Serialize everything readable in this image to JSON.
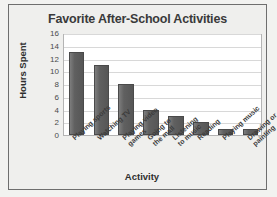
{
  "chart_data": {
    "type": "bar",
    "title": "Favorite After-School Activities",
    "xlabel": "Activity",
    "ylabel": "Hours Spent",
    "categories": [
      "Playing sports",
      "Watching TV",
      "Playing video games",
      "Going to the mall",
      "Listening to music",
      "Reading",
      "Playing music",
      "Drawing or painting"
    ],
    "category_lines": [
      "Playing sports",
      "Watching TV",
      "Playing video\ngames",
      "Going to\nthe mall",
      "Listening\nto music",
      "Reading",
      "Playing music",
      "Drawing or\npainting"
    ],
    "values": [
      13,
      11,
      8,
      4,
      3,
      2,
      1,
      1
    ],
    "ylim": [
      0,
      16
    ],
    "ytick_step": 2,
    "yticks": [
      "0",
      "2",
      "4",
      "6",
      "8",
      "10",
      "12",
      "14",
      "16"
    ],
    "grid": true,
    "legend": false,
    "bar_color": "#5e5e5e",
    "plot_background": "#ffffff",
    "figure_background": "#efefed",
    "gridline_color": "#d8d8d8",
    "title_color": "#3a3a3a",
    "axis_text_color": "#2e2e2e"
  }
}
